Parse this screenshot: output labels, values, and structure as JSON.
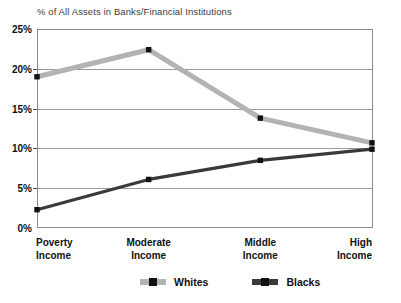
{
  "chart_data": {
    "type": "line",
    "title": "% of All Assets in Banks/Financial Institutions",
    "xlabel": "",
    "ylabel": "",
    "ylim": [
      0,
      25
    ],
    "ytick_values": [
      0,
      5,
      10,
      15,
      20,
      25
    ],
    "ytick_labels": [
      "0%",
      "5%",
      "10%",
      "15%",
      "20%",
      "25%"
    ],
    "grid": true,
    "legend_position": "bottom",
    "categories": [
      "Poverty Income",
      "Moderate Income",
      "Middle Income",
      "High Income"
    ],
    "category_lines": [
      [
        "Poverty",
        "Income"
      ],
      [
        "Moderate",
        "Income"
      ],
      [
        "Middle",
        "Income"
      ],
      [
        "High",
        "Income"
      ]
    ],
    "series": [
      {
        "name": "Whites",
        "color": "#b3b3b3",
        "marker_color": "#111111",
        "values": [
          19.0,
          22.4,
          13.8,
          10.7
        ]
      },
      {
        "name": "Blacks",
        "color": "#3a3a3a",
        "marker_color": "#111111",
        "values": [
          2.3,
          6.1,
          8.5,
          9.9
        ]
      }
    ]
  },
  "legend": {
    "entries": [
      {
        "label": "Whites",
        "color": "#b3b3b3"
      },
      {
        "label": "Blacks",
        "color": "#3a3a3a"
      }
    ]
  },
  "colors": {
    "whites_line": "#b3b3b3",
    "blacks_line": "#3a3a3a",
    "axis": "#8a8a8a",
    "gridline": "#9a9a9a",
    "text": "#111111",
    "title_text": "#3c3c3c",
    "background": "#ffffff"
  }
}
